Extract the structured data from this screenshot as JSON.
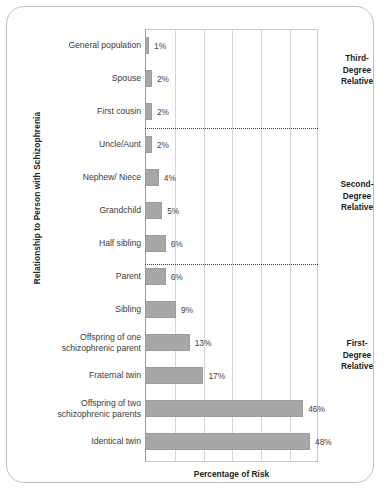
{
  "chart_data": {
    "type": "bar",
    "orientation": "horizontal",
    "title": "",
    "xlabel": "Percentage of Risk",
    "ylabel": "Relationship to Person with Schizophrenia",
    "xlim": [
      0,
      48
    ],
    "grid": true,
    "legend": "none",
    "categories": [
      "General population",
      "Spouse",
      "First cousin",
      "Uncle/Aunt",
      "Nephew/ Niece",
      "Grandchild",
      "Half sibling",
      "Parent",
      "Sibling",
      "Offspring of one schizophrenic parent",
      "Fraternal twin",
      "Offspring of two schizophrenic parents",
      "Identical twin"
    ],
    "values": [
      1,
      2,
      2,
      2,
      4,
      5,
      6,
      6,
      9,
      13,
      17,
      46,
      48
    ],
    "value_labels": [
      "1%",
      "2%",
      "2%",
      "2%",
      "4%",
      "5%",
      "6%",
      "6%",
      "9%",
      "13%",
      "17%",
      "46%",
      "48%"
    ],
    "bar_color": "#a7a7a7",
    "grid_color": "#d5d5d5",
    "axis_color": "#9a9a9a"
  },
  "rows": [
    {
      "label_line1": "General population",
      "label_line2": "",
      "value": 1,
      "value_label": "1%"
    },
    {
      "label_line1": "Spouse",
      "label_line2": "",
      "value": 2,
      "value_label": "2%"
    },
    {
      "label_line1": "First cousin",
      "label_line2": "",
      "value": 2,
      "value_label": "2%"
    },
    {
      "label_line1": "Uncle/Aunt",
      "label_line2": "",
      "value": 2,
      "value_label": "2%"
    },
    {
      "label_line1": "Nephew/ Niece",
      "label_line2": "",
      "value": 4,
      "value_label": "4%"
    },
    {
      "label_line1": "Grandchild",
      "label_line2": "",
      "value": 5,
      "value_label": "5%"
    },
    {
      "label_line1": "Half sibling",
      "label_line2": "",
      "value": 6,
      "value_label": "6%"
    },
    {
      "label_line1": "Parent",
      "label_line2": "",
      "value": 6,
      "value_label": "6%"
    },
    {
      "label_line1": "Sibling",
      "label_line2": "",
      "value": 9,
      "value_label": "9%"
    },
    {
      "label_line1": "Offspring of one",
      "label_line2": "schizophrenic parent",
      "value": 13,
      "value_label": "13%"
    },
    {
      "label_line1": "Fraternal twin",
      "label_line2": "",
      "value": 17,
      "value_label": "17%"
    },
    {
      "label_line1": "Offspring of two",
      "label_line2": "schizophrenic parents",
      "value": 46,
      "value_label": "46%"
    },
    {
      "label_line1": "Identical twin",
      "label_line2": "",
      "value": 48,
      "value_label": "48%"
    }
  ],
  "groups": [
    {
      "line1": "Third-",
      "line2": "Degree",
      "line3": "Relative"
    },
    {
      "line1": "Second-",
      "line2": "Degree",
      "line3": "Relative"
    },
    {
      "line1": "First-",
      "line2": "Degree",
      "line3": "Relative"
    }
  ],
  "axis": {
    "x_title": "Percentage of Risk",
    "y_title": "Relationship to Person with Schizophrenia"
  }
}
